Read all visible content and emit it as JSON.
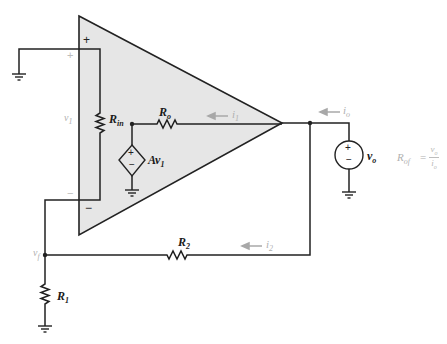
{
  "diagram": {
    "colors": {
      "wire": "#222222",
      "amp_fill": "#e6e6e6",
      "faint_annotation": "#b0b0b0",
      "arrow": "#a8a8a8"
    },
    "amplifier": {
      "plus_terminal": "+",
      "minus_terminal": "−",
      "outer_plus": "+",
      "outer_minus": "−"
    },
    "components": {
      "rin": {
        "name": "R",
        "sub": "in"
      },
      "ro": {
        "name": "R",
        "sub": "o"
      },
      "dependent_source": {
        "name": "Av",
        "sub": "1",
        "plus": "+",
        "minus": "−"
      },
      "r1": {
        "name": "R",
        "sub": "1"
      },
      "r2": {
        "name": "R",
        "sub": "2"
      },
      "vo_source": {
        "name": "v",
        "sub": "o",
        "plus": "+",
        "minus": "−"
      }
    },
    "node_labels": {
      "v1": {
        "name": "v",
        "sub": "1"
      },
      "vf": {
        "name": "v",
        "sub": "f"
      }
    },
    "currents": {
      "i1": {
        "name": "i",
        "sub": "1"
      },
      "i2": {
        "name": "i",
        "sub": "2"
      },
      "io": {
        "name": "i",
        "sub": "o"
      }
    },
    "formula": {
      "lhs_name": "R",
      "lhs_sub": "of",
      "equals": "=",
      "numerator_name": "v",
      "numerator_sub": "o",
      "denominator_name": "i",
      "denominator_sub": "o"
    }
  }
}
